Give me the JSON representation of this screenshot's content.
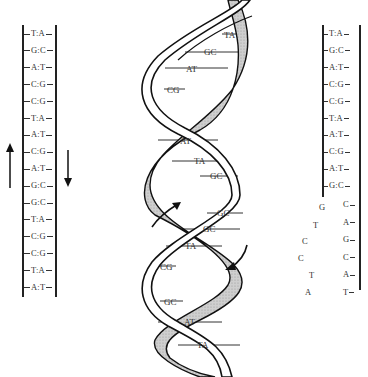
{
  "left_ladder": {
    "pairs": [
      "T:A",
      "G:C",
      "A:T",
      "C:G",
      "C:G",
      "T:A",
      "A:T",
      "C:G",
      "A:T",
      "G:C",
      "G:C",
      "T:A",
      "C:G",
      "C:G",
      "T:A",
      "A:T"
    ],
    "arrow_left": "up",
    "arrow_right": "down"
  },
  "right_ladder": {
    "paired": [
      "T:A",
      "G:C",
      "A:T",
      "C:G",
      "C:G",
      "T:A",
      "A:T",
      "C:G",
      "A:T",
      "G:C"
    ],
    "unpaired_right": [
      "C",
      "A",
      "G",
      "C",
      "A",
      "T"
    ],
    "free_bases": [
      "G",
      "T",
      "C",
      "C",
      "T",
      "A"
    ]
  },
  "helix": {
    "base_pairs": [
      "TA",
      "GC",
      "AT",
      "CG",
      "AT",
      "TA",
      "GC",
      "GC",
      "GC",
      "TA",
      "CG",
      "GC",
      "AT",
      "TA"
    ],
    "arrow_up": "strand direction up",
    "arrow_down": "strand direction down"
  }
}
